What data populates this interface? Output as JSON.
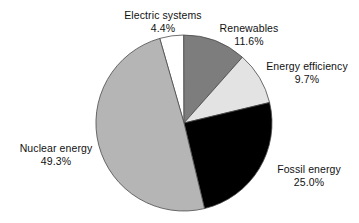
{
  "chart_data": {
    "type": "pie",
    "title": "",
    "subtitle": "",
    "xlabel": "",
    "ylabel": "",
    "grid": false,
    "legend_position": "none",
    "labels_position": "outside-callout",
    "units": "percent",
    "total": 100.0,
    "start_angle_deg": -16,
    "direction": "clockwise",
    "categories": [
      "Electric systems",
      "Renewables",
      "Energy efficiency",
      "Fossil energy",
      "Nuclear energy"
    ],
    "values": [
      4.4,
      11.6,
      9.7,
      25.0,
      49.3
    ],
    "slices": [
      {
        "name": "Electric systems",
        "value": 4.4,
        "value_label": "4.4%",
        "color": "#ffffff",
        "edge_color": "#4a4a4a"
      },
      {
        "name": "Renewables",
        "value": 11.6,
        "value_label": "11.6%",
        "color": "#7d7d7d",
        "edge_color": "#4a4a4a"
      },
      {
        "name": "Energy efficiency",
        "value": 9.7,
        "value_label": "9.7%",
        "color": "#e3e3e3",
        "edge_color": "#4a4a4a"
      },
      {
        "name": "Fossil energy",
        "value": 25.0,
        "value_label": "25.0%",
        "color": "#000000",
        "edge_color": "#4a4a4a"
      },
      {
        "name": "Nuclear energy",
        "value": 49.3,
        "value_label": "49.3%",
        "color": "#b5b5b5",
        "edge_color": "#4a4a4a"
      }
    ]
  },
  "geometry": {
    "center_x": 184,
    "center_y": 123,
    "radius": 88
  },
  "labels": {
    "electric_systems": {
      "name": "Electric systems",
      "percent": "4.4%"
    },
    "renewables": {
      "name": "Renewables",
      "percent": "11.6%"
    },
    "energy_efficiency": {
      "name": "Energy efficiency",
      "percent": "9.7%"
    },
    "fossil_energy": {
      "name": "Fossil energy",
      "percent": "25.0%"
    },
    "nuclear_energy": {
      "name": "Nuclear energy",
      "percent": "49.3%"
    }
  },
  "colors": {
    "background": "#ffffff",
    "text": "#111111",
    "slice_outline": "#4a4a4a"
  }
}
